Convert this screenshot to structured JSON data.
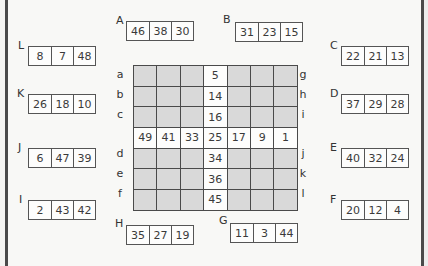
{
  "groups": {
    "A": {
      "label": "A",
      "values": [
        "46",
        "38",
        "30"
      ]
    },
    "B": {
      "label": "B",
      "values": [
        "31",
        "23",
        "15"
      ]
    },
    "C": {
      "label": "C",
      "values": [
        "22",
        "21",
        "13"
      ]
    },
    "D": {
      "label": "D",
      "values": [
        "37",
        "29",
        "28"
      ]
    },
    "E": {
      "label": "E",
      "values": [
        "40",
        "32",
        "24"
      ]
    },
    "F": {
      "label": "F",
      "values": [
        "20",
        "12",
        "4"
      ]
    },
    "G": {
      "label": "G",
      "values": [
        "11",
        "3",
        "44"
      ]
    },
    "H": {
      "label": "H",
      "values": [
        "35",
        "27",
        "19"
      ]
    },
    "I": {
      "label": "I",
      "values": [
        "2",
        "43",
        "42"
      ]
    },
    "J": {
      "label": "J",
      "values": [
        "6",
        "47",
        "39"
      ]
    },
    "K": {
      "label": "K",
      "values": [
        "26",
        "18",
        "10"
      ]
    },
    "L": {
      "label": "L",
      "values": [
        "8",
        "7",
        "48"
      ]
    }
  },
  "grid": {
    "rows": [
      [
        "",
        "",
        "",
        "5",
        "",
        "",
        ""
      ],
      [
        "",
        "",
        "",
        "14",
        "",
        "",
        ""
      ],
      [
        "",
        "",
        "",
        "16",
        "",
        "",
        ""
      ],
      [
        "49",
        "41",
        "33",
        "25",
        "17",
        "9",
        "1"
      ],
      [
        "",
        "",
        "",
        "34",
        "",
        "",
        ""
      ],
      [
        "",
        "",
        "",
        "36",
        "",
        "",
        ""
      ],
      [
        "",
        "",
        "",
        "45",
        "",
        "",
        ""
      ]
    ],
    "left_labels": [
      "a",
      "b",
      "c",
      "",
      "d",
      "e",
      "f"
    ],
    "right_labels": [
      "g",
      "h",
      "i",
      "",
      "j",
      "k",
      "l"
    ]
  },
  "colors": {
    "shaded_cell": "#d9d9d9",
    "open_cell": "#fdfdfc",
    "border": "#4a4a4a"
  }
}
